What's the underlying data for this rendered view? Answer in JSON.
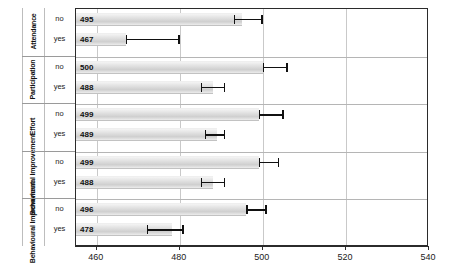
{
  "chart_data": {
    "type": "bar",
    "orientation": "horizontal",
    "title": "",
    "xlabel": "",
    "ylabel": "",
    "xlim": [
      455,
      540
    ],
    "xticks": [
      460,
      480,
      500,
      520,
      540
    ],
    "grid": true,
    "legend": "none",
    "group_label_key": "group",
    "categories": [
      "no",
      "yes"
    ],
    "groups": [
      {
        "group": "Attendance",
        "rows": [
          {
            "category": "no",
            "value": 495,
            "err_low": 493,
            "err_high": 500
          },
          {
            "category": "yes",
            "value": 467,
            "err_low": 467,
            "err_high": 480
          }
        ]
      },
      {
        "group": "Participation",
        "rows": [
          {
            "category": "no",
            "value": 500,
            "err_low": 500,
            "err_high": 506
          },
          {
            "category": "yes",
            "value": 488,
            "err_low": 485,
            "err_high": 491
          }
        ]
      },
      {
        "group": "Effort",
        "rows": [
          {
            "category": "no",
            "value": 499,
            "err_low": 499,
            "err_high": 505
          },
          {
            "category": "yes",
            "value": 489,
            "err_low": 486,
            "err_high": 491
          }
        ]
      },
      {
        "group": "Behavioural Improvement",
        "rows": [
          {
            "category": "no",
            "value": 499,
            "err_low": 499,
            "err_high": 504
          },
          {
            "category": "yes",
            "value": 488,
            "err_low": 485,
            "err_high": 491
          }
        ]
      },
      {
        "group": "Behavioural Improvement",
        "rows": [
          {
            "category": "no",
            "value": 496,
            "err_low": 496,
            "err_high": 501
          },
          {
            "category": "yes",
            "value": 478,
            "err_low": 472,
            "err_high": 481
          }
        ]
      }
    ]
  },
  "colors": {
    "bar_fill": "#dcdcdc",
    "bar_edge": "#c2c2c2",
    "error_bar": "#111111",
    "gridline": "#c9c9c9",
    "axis": "#2b2b2b",
    "background": "#ffffff"
  }
}
